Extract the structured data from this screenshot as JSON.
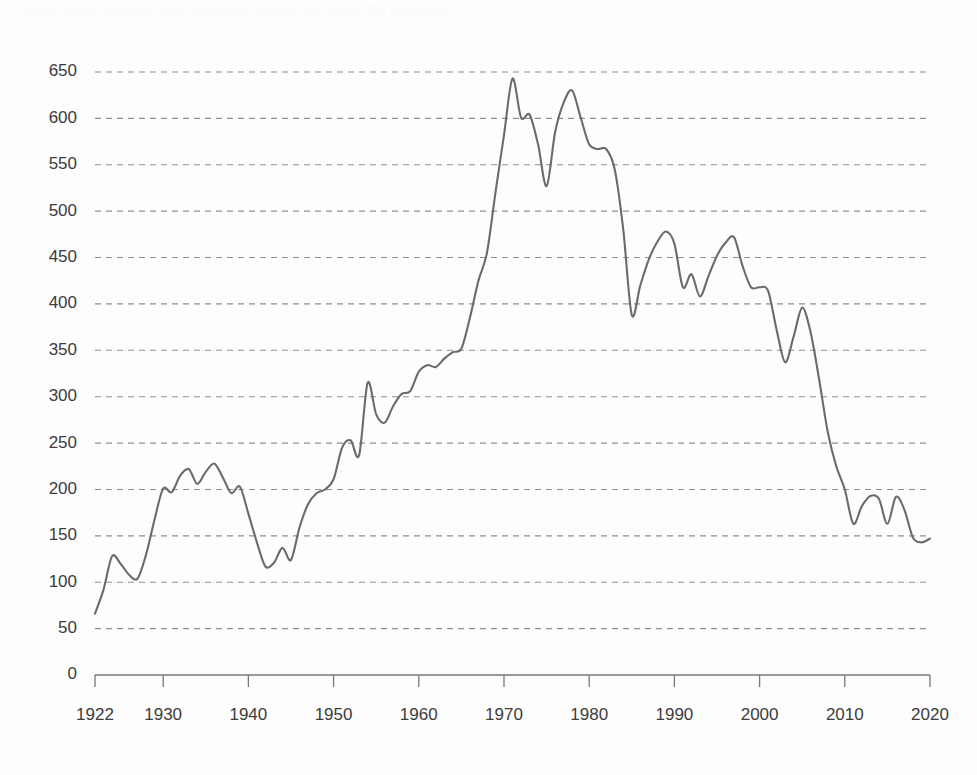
{
  "page": {
    "background_color": "#fdfdfd",
    "faint_header_text": "Some series title and some other faint header text above the chart area"
  },
  "chart_data": {
    "type": "line",
    "title": "",
    "subtitle": "",
    "xlabel": "",
    "ylabel": "",
    "xlim": [
      1922,
      2020
    ],
    "ylim": [
      0,
      650
    ],
    "grid": true,
    "grid_axis": "y",
    "legend": false,
    "legend_position": "none",
    "line_color": "#6b6b6b",
    "grid_color": "#8e8e8e",
    "axis_color": "#777777",
    "x_tick_labels": [
      "1922",
      "1930",
      "1940",
      "1950",
      "1960",
      "1970",
      "1980",
      "1990",
      "2000",
      "2010",
      "2020"
    ],
    "x_tick_values": [
      1922,
      1930,
      1940,
      1950,
      1960,
      1970,
      1980,
      1990,
      2000,
      2010,
      2020
    ],
    "y_tick_labels": [
      "0",
      "50",
      "100",
      "150",
      "200",
      "250",
      "300",
      "350",
      "400",
      "450",
      "500",
      "550",
      "600",
      "650"
    ],
    "y_tick_values": [
      0,
      50,
      100,
      150,
      200,
      250,
      300,
      350,
      400,
      450,
      500,
      550,
      600,
      650
    ],
    "series": [
      {
        "name": "series-1",
        "color": "#6b6b6b",
        "x": [
          1922,
          1923,
          1924,
          1925,
          1926,
          1927,
          1928,
          1929,
          1930,
          1931,
          1932,
          1933,
          1934,
          1935,
          1936,
          1937,
          1938,
          1939,
          1940,
          1941,
          1942,
          1943,
          1944,
          1945,
          1946,
          1947,
          1948,
          1949,
          1950,
          1951,
          1952,
          1953,
          1954,
          1955,
          1956,
          1957,
          1958,
          1959,
          1960,
          1961,
          1962,
          1963,
          1964,
          1965,
          1966,
          1967,
          1968,
          1969,
          1970,
          1971,
          1972,
          1973,
          1974,
          1975,
          1976,
          1977,
          1978,
          1979,
          1980,
          1981,
          1982,
          1983,
          1984,
          1985,
          1986,
          1987,
          1988,
          1989,
          1990,
          1991,
          1992,
          1993,
          1994,
          1995,
          1996,
          1997,
          1998,
          1999,
          2000,
          2001,
          2002,
          2003,
          2004,
          2005,
          2006,
          2007,
          2008,
          2009,
          2010,
          2011,
          2012,
          2013,
          2014,
          2015,
          2016,
          2017,
          2018,
          2019,
          2020
        ],
        "y": [
          66,
          92,
          128,
          120,
          108,
          104,
          130,
          168,
          201,
          197,
          215,
          222,
          206,
          219,
          228,
          213,
          196,
          203,
          174,
          143,
          117,
          121,
          137,
          124,
          159,
          184,
          196,
          200,
          211,
          245,
          253,
          237,
          315,
          281,
          272,
          290,
          303,
          306,
          327,
          334,
          332,
          341,
          348,
          352,
          385,
          425,
          455,
          520,
          582,
          643,
          601,
          604,
          572,
          527,
          585,
          617,
          630,
          601,
          572,
          567,
          567,
          545,
          480,
          388,
          420,
          448,
          467,
          478,
          465,
          418,
          432,
          408,
          430,
          452,
          466,
          472,
          441,
          418,
          418,
          414,
          372,
          337,
          365,
          396,
          369,
          318,
          262,
          225,
          200,
          163,
          182,
          193,
          190,
          163,
          192,
          178,
          148,
          143,
          147
        ]
      }
    ]
  }
}
